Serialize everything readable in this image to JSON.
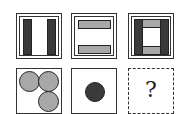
{
  "puzzle": {
    "rows": [
      {
        "cells": [
          {
            "id": "r1c1",
            "description": "two vertical dark bars in double-bordered square"
          },
          {
            "id": "r1c2",
            "description": "two horizontal grey bars in double-bordered square"
          },
          {
            "id": "r1c3",
            "description": "two vertical dark bars and two horizontal grey bars forming a frame"
          }
        ]
      },
      {
        "cells": [
          {
            "id": "r2c1",
            "description": "three grey circles"
          },
          {
            "id": "r2c2",
            "description": "one dark circle"
          },
          {
            "id": "r2c3",
            "description": "unknown answer cell",
            "label": "?"
          }
        ]
      }
    ],
    "colors": {
      "dark": "#3a3a3a",
      "grey": "#a8a8a8",
      "border": "#333333"
    }
  }
}
